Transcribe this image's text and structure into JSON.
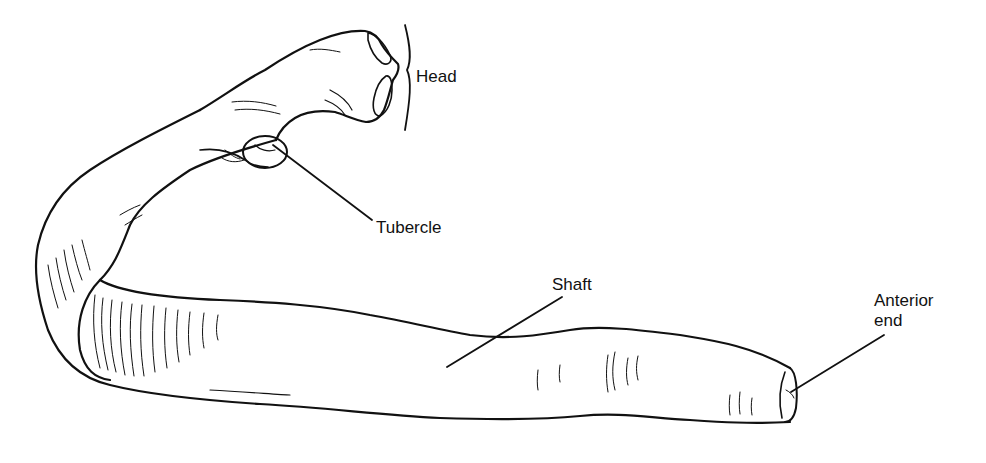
{
  "figure": {
    "colors": {
      "ink": "#111111",
      "background": "#ffffff"
    }
  },
  "labels": {
    "head": "Head",
    "tubercle": "Tubercle",
    "shaft": "Shaft",
    "anterior_end_line1": "Anterior",
    "anterior_end_line2": "end"
  }
}
